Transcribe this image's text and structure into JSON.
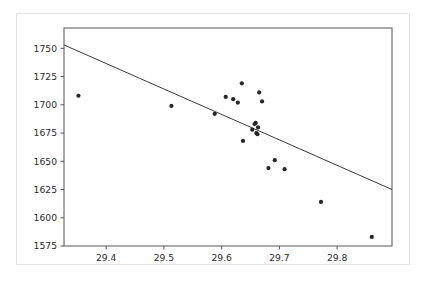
{
  "chart_data": {
    "type": "scatter",
    "title": "",
    "xlabel": "",
    "ylabel": "",
    "xlim": [
      29.327,
      29.895
    ],
    "ylim": [
      1575,
      1768
    ],
    "grid": false,
    "legend": null,
    "xticks": [
      29.4,
      29.5,
      29.6,
      29.7,
      29.8
    ],
    "xtick_labels": [
      "29.4",
      "29.5",
      "29.6",
      "29.7",
      "29.8"
    ],
    "yticks": [
      1575,
      1600,
      1625,
      1650,
      1675,
      1700,
      1725,
      1750
    ],
    "ytick_labels": [
      "1575",
      "1600",
      "1625",
      "1650",
      "1675",
      "1700",
      "1725",
      "1750"
    ],
    "marker": "point",
    "marker_color": "#262626",
    "marker_size": 2.1,
    "series": [
      {
        "name": "observations",
        "points": [
          {
            "x": 29.352,
            "y": 1708
          },
          {
            "x": 29.513,
            "y": 1699
          },
          {
            "x": 29.588,
            "y": 1692
          },
          {
            "x": 29.607,
            "y": 1707
          },
          {
            "x": 29.62,
            "y": 1705
          },
          {
            "x": 29.628,
            "y": 1702
          },
          {
            "x": 29.635,
            "y": 1719
          },
          {
            "x": 29.637,
            "y": 1668
          },
          {
            "x": 29.653,
            "y": 1678
          },
          {
            "x": 29.657,
            "y": 1683
          },
          {
            "x": 29.659,
            "y": 1684
          },
          {
            "x": 29.66,
            "y": 1675
          },
          {
            "x": 29.662,
            "y": 1674
          },
          {
            "x": 29.663,
            "y": 1680
          },
          {
            "x": 29.665,
            "y": 1711
          },
          {
            "x": 29.67,
            "y": 1703
          },
          {
            "x": 29.681,
            "y": 1644
          },
          {
            "x": 29.692,
            "y": 1651
          },
          {
            "x": 29.709,
            "y": 1643
          },
          {
            "x": 29.772,
            "y": 1614
          },
          {
            "x": 29.86,
            "y": 1583
          }
        ]
      }
    ],
    "fit_line": {
      "name": "least-squares-fit",
      "color": "#3a3a3a",
      "x_start": 29.327,
      "y_start": 1753,
      "x_end": 29.895,
      "y_end": 1625
    }
  }
}
